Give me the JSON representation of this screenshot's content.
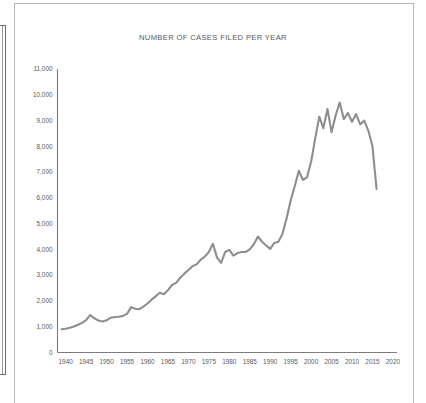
{
  "chart_data": {
    "type": "line",
    "title": "NUMBER OF CASES FILED PER YEAR",
    "xlabel": "",
    "ylabel": "",
    "xlim": [
      1938,
      2021
    ],
    "ylim": [
      0,
      11000
    ],
    "grid": false,
    "legend": null,
    "line_color": "#8d8e90",
    "axis_color": "#7b7c7e",
    "y_ticks": [
      0,
      1000,
      2000,
      3000,
      4000,
      5000,
      6000,
      7000,
      8000,
      9000,
      10000,
      11000
    ],
    "y_tick_labels": [
      "0",
      "1,000",
      "2,000",
      "3,000",
      "4,000",
      "5,000",
      "6,000",
      "7,000",
      "8,000",
      "9,000",
      "10,000",
      "11,000"
    ],
    "x_ticks": [
      1940,
      1945,
      1950,
      1955,
      1960,
      1965,
      1970,
      1975,
      1980,
      1985,
      1990,
      1995,
      2000,
      2005,
      2010,
      2015,
      2020
    ],
    "x_tick_labels": [
      "1940",
      "1945",
      "1950",
      "1955",
      "1960",
      "1965",
      "1970",
      "1975",
      "1980",
      "1985",
      "1990",
      "1995",
      "2000",
      "2005",
      "2010",
      "2015",
      "2020"
    ],
    "series": [
      {
        "name": "Cases filed",
        "x": [
          1939,
          1940,
          1941,
          1942,
          1943,
          1944,
          1945,
          1946,
          1947,
          1948,
          1949,
          1950,
          1951,
          1952,
          1953,
          1954,
          1955,
          1956,
          1957,
          1958,
          1959,
          1960,
          1961,
          1962,
          1963,
          1964,
          1965,
          1966,
          1967,
          1968,
          1969,
          1970,
          1971,
          1972,
          1973,
          1974,
          1975,
          1976,
          1977,
          1978,
          1979,
          1980,
          1981,
          1982,
          1983,
          1984,
          1985,
          1986,
          1987,
          1988,
          1989,
          1990,
          1991,
          1992,
          1993,
          1994,
          1995,
          1996,
          1997,
          1998,
          1999,
          2000,
          2001,
          2002,
          2003,
          2004,
          2005,
          2006,
          2007,
          2008,
          2009,
          2010,
          2011,
          2012,
          2013,
          2014,
          2015,
          2016
        ],
        "values": [
          900,
          920,
          960,
          1010,
          1080,
          1150,
          1260,
          1450,
          1330,
          1240,
          1200,
          1250,
          1350,
          1380,
          1390,
          1420,
          1500,
          1760,
          1700,
          1680,
          1780,
          1900,
          2050,
          2180,
          2320,
          2260,
          2420,
          2620,
          2700,
          2900,
          3060,
          3200,
          3350,
          3420,
          3600,
          3720,
          3900,
          4220,
          3680,
          3480,
          3900,
          3980,
          3760,
          3860,
          3900,
          3900,
          4000,
          4200,
          4500,
          4300,
          4150,
          4020,
          4250,
          4300,
          4600,
          5200,
          5900,
          6450,
          7050,
          6700,
          6800,
          7400,
          8300,
          9150,
          8700,
          9450,
          8550,
          9200,
          9700,
          9050,
          9300,
          8950,
          9250,
          8850,
          9000,
          8600,
          8000,
          6350
        ]
      }
    ]
  },
  "page": {
    "left_panel_name": "cropped-side-panel"
  }
}
